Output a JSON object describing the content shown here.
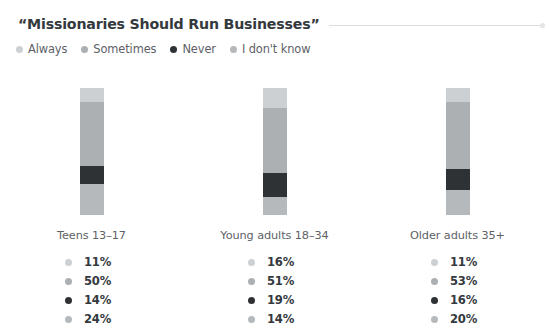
{
  "header": {
    "title": "“Missionaries Should Run Businesses”",
    "rule_endcap_icon": "rule-endcap-dot"
  },
  "legend": {
    "position": "top-left",
    "items": [
      {
        "label": "Always",
        "color": "#cdd0d2"
      },
      {
        "label": "Sometimes",
        "color": "#adb0b3"
      },
      {
        "label": "Never",
        "color": "#2f3235"
      },
      {
        "label": "I don't know",
        "color": "#b6b9bb"
      }
    ]
  },
  "chart_data": {
    "type": "bar",
    "subtype": "stacked-100-percent",
    "orientation": "vertical",
    "title": "“Missionaries Should Run Businesses”",
    "subtitle": "",
    "xlabel": "",
    "ylabel": "",
    "ylim": [
      0,
      100
    ],
    "grid": false,
    "legend_position": "top-left",
    "value_suffix": "%",
    "categories": [
      "Teens 13–17",
      "Young adults 18–34",
      "Older adults 35+"
    ],
    "series": [
      {
        "name": "Always",
        "color": "#cdd0d2",
        "values": [
          11,
          50,
          11
        ]
      },
      {
        "name": "Sometimes",
        "color": "#adb0b3",
        "values": [
          50,
          51,
          53
        ]
      },
      {
        "name": "Never",
        "color": "#2f3235",
        "values": [
          14,
          19,
          16
        ]
      },
      {
        "name": "I don't know",
        "color": "#b6b9bb",
        "values": [
          24,
          14,
          20
        ]
      }
    ],
    "groups": [
      {
        "label": "Teens 13–17",
        "segments": [
          {
            "name": "Always",
            "value": 11,
            "display": "11%",
            "color": "#cdd0d2"
          },
          {
            "name": "Sometimes",
            "value": 50,
            "display": "50%",
            "color": "#adb0b3"
          },
          {
            "name": "Never",
            "value": 14,
            "display": "14%",
            "color": "#2f3235"
          },
          {
            "name": "I don't know",
            "value": 24,
            "display": "24%",
            "color": "#b6b9bb"
          }
        ]
      },
      {
        "label": "Young adults 18–34",
        "segments": [
          {
            "name": "Always",
            "value": 16,
            "display": "16%",
            "color": "#cdd0d2"
          },
          {
            "name": "Sometimes",
            "value": 51,
            "display": "51%",
            "color": "#adb0b3"
          },
          {
            "name": "Never",
            "value": 19,
            "display": "19%",
            "color": "#2f3235"
          },
          {
            "name": "I don't know",
            "value": 14,
            "display": "14%",
            "color": "#b6b9bb"
          }
        ]
      },
      {
        "label": "Older adults 35+",
        "segments": [
          {
            "name": "Always",
            "value": 11,
            "display": "11%",
            "color": "#cdd0d2"
          },
          {
            "name": "Sometimes",
            "value": 53,
            "display": "53%",
            "color": "#adb0b3"
          },
          {
            "name": "Never",
            "value": 16,
            "display": "16%",
            "color": "#2f3235"
          },
          {
            "name": "I don't know",
            "value": 20,
            "display": "20%",
            "color": "#b6b9bb"
          }
        ]
      }
    ]
  }
}
